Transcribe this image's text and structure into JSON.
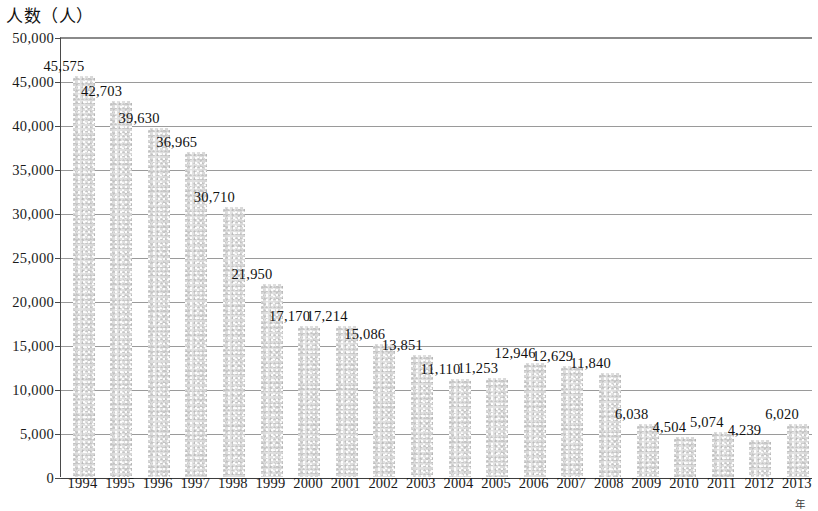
{
  "chart_data": {
    "type": "bar",
    "title": "人数（人）",
    "xlabel": "年",
    "ylabel": "人数（人）",
    "categories": [
      "1994",
      "1995",
      "1996",
      "1997",
      "1998",
      "1999",
      "2000",
      "2001",
      "2002",
      "2003",
      "2004",
      "2005",
      "2006",
      "2007",
      "2008",
      "2009",
      "2010",
      "2011",
      "2012",
      "2013"
    ],
    "values": [
      45575,
      42703,
      39630,
      36965,
      30710,
      21950,
      17170,
      17214,
      15086,
      13851,
      11110,
      11253,
      12946,
      12629,
      11840,
      6038,
      4504,
      5074,
      4239,
      6020
    ],
    "value_labels": [
      "45,575",
      "42,703",
      "39,630",
      "36,965",
      "30,710",
      "21,950",
      "17,170",
      "17,214",
      "15,086",
      "13,851",
      "11,110",
      "11,253",
      "12,946",
      "12,629",
      "11,840",
      "6,038",
      "4,504",
      "5,074",
      "4,239",
      "6,020"
    ],
    "ylim": [
      0,
      50000
    ],
    "ytick_values": [
      0,
      5000,
      10000,
      15000,
      20000,
      25000,
      30000,
      35000,
      40000,
      45000,
      50000
    ],
    "ytick_labels": [
      "0",
      "5,000",
      "10,000",
      "15,000",
      "20,000",
      "25,000",
      "30,000",
      "35,000",
      "40,000",
      "45,000",
      "50,000"
    ],
    "grid": true,
    "legend": false,
    "bar_color": "#e2e2e2",
    "axis_color": "#3c3c3c",
    "gridline_color": "#9a9a9a",
    "text_color": "#111111"
  }
}
